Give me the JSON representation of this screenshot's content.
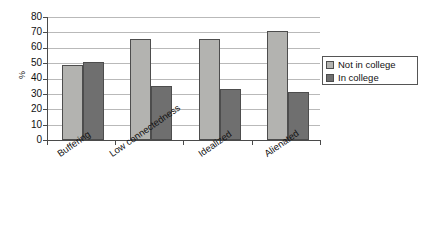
{
  "chart_data": {
    "type": "bar",
    "title": "",
    "subtitle": "",
    "xlabel": "",
    "ylabel": "%",
    "ylim": [
      0,
      80
    ],
    "yticks": [
      0,
      10,
      20,
      30,
      40,
      50,
      60,
      70,
      80
    ],
    "ytick_labels": [
      "0",
      "10",
      "20",
      "30",
      "40",
      "50",
      "60",
      "70",
      "80"
    ],
    "grid": true,
    "legend_position": "right",
    "categories": [
      "Buffering",
      "Low connectedness",
      "Idealized",
      "Alienated"
    ],
    "series": [
      {
        "name": "Not in college",
        "color": "#b3b3b0",
        "values": [
          49,
          66,
          66,
          71
        ]
      },
      {
        "name": "In college",
        "color": "#6f6f6f",
        "values": [
          51,
          35,
          33,
          31
        ]
      }
    ]
  },
  "legend": {
    "items": [
      {
        "label": "Not in college",
        "swatch": "light"
      },
      {
        "label": "In college",
        "swatch": "dark"
      }
    ]
  },
  "colors": {
    "not_in_college": "#b3b3b0",
    "in_college": "#6f6f6f",
    "axis": "#4a4a4a",
    "gridline": "#b9b9b9",
    "background": "#ffffff"
  }
}
